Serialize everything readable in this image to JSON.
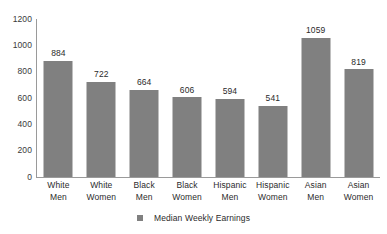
{
  "chart_data": {
    "type": "bar",
    "title": "",
    "xlabel": "",
    "ylabel": "",
    "categories": [
      "White Men",
      "White Women",
      "Black Men",
      "Black Women",
      "Hispanic Men",
      "Hispanic Women",
      "Asian Men",
      "Asian Women"
    ],
    "category_lines": [
      [
        "White",
        "Men"
      ],
      [
        "White",
        "Women"
      ],
      [
        "Black",
        "Men"
      ],
      [
        "Black",
        "Women"
      ],
      [
        "Hispanic",
        "Men"
      ],
      [
        "Hispanic",
        "Women"
      ],
      [
        "Asian",
        "Men"
      ],
      [
        "Asian",
        "Women"
      ]
    ],
    "values": [
      884,
      722,
      664,
      606,
      594,
      541,
      1059,
      819
    ],
    "series": [
      {
        "name": "Median Weekly Earnings",
        "values": [
          884,
          722,
          664,
          606,
          594,
          541,
          1059,
          819
        ]
      }
    ],
    "ylim": [
      0,
      1200
    ],
    "ytick_labels": [
      "1200",
      "1000",
      "800",
      "600",
      "400",
      "200",
      "0"
    ],
    "ytick_values": [
      1200,
      1000,
      800,
      600,
      400,
      200,
      0
    ],
    "grid": false,
    "legend_position": "bottom-center",
    "legend": [
      {
        "label": "Median Weekly Earnings",
        "color": "#808080"
      }
    ],
    "bar_color": "#808080",
    "axis_color": "#9a9a9a",
    "background_color": "#ffffff",
    "data_labels_shown": true
  }
}
